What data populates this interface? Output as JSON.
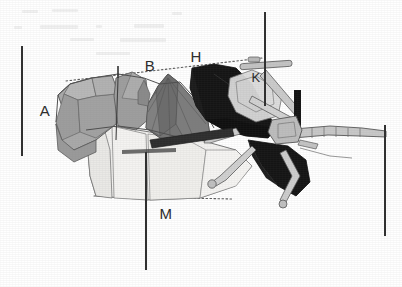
{
  "figure": {
    "background_color": "#ffffff",
    "width": 402,
    "height": 287,
    "palette": {
      "ink": "#2a2a2a",
      "black_fill": "#131313",
      "dark_gray": "#6f6f6f",
      "mid_gray": "#8d8d8d",
      "light_gray": "#a8a8a8",
      "pale_gray": "#c9c9c9",
      "near_white": "#f0f0ef",
      "outline": "#4a4a4a",
      "dotted_guide": "#5a5a5a"
    },
    "labels": [
      {
        "id": "label-a",
        "text": "A",
        "x": 45,
        "y": 116
      },
      {
        "id": "label-i",
        "text": "I",
        "x": 118,
        "y": 73
      },
      {
        "id": "label-b",
        "text": "B",
        "x": 150,
        "y": 71
      },
      {
        "id": "label-h",
        "text": "H",
        "x": 196,
        "y": 62
      },
      {
        "id": "label-k",
        "text": "K",
        "x": 256,
        "y": 82
      },
      {
        "id": "label-m",
        "text": "M",
        "x": 166,
        "y": 219
      }
    ],
    "reference_bars": [
      {
        "id": "scale-bar-left",
        "x1": 22,
        "y1": 46,
        "x2": 22,
        "y2": 156
      },
      {
        "id": "scale-bar-top-right",
        "x1": 265,
        "y1": 12,
        "x2": 265,
        "y2": 106
      },
      {
        "id": "scale-bar-bottom-mid",
        "x1": 146,
        "y1": 152,
        "x2": 146,
        "y2": 270
      },
      {
        "id": "scale-bar-right",
        "x1": 385,
        "y1": 125,
        "x2": 385,
        "y2": 236
      }
    ],
    "guide_lines": [
      {
        "id": "guide-top-dotted",
        "x1": 66,
        "y1": 81,
        "x2": 262,
        "y2": 58
      },
      {
        "id": "guide-bottom-dotted",
        "x1": 94,
        "y1": 196,
        "x2": 232,
        "y2": 199
      }
    ],
    "leader_ticks": [
      {
        "id": "tick-i",
        "x1": 118,
        "y1": 66,
        "x2": 118,
        "y2": 78
      }
    ],
    "regions": [
      {
        "id": "body-left-light",
        "tone": "light_gray"
      },
      {
        "id": "body-dome-dark",
        "tone": "dark_gray"
      },
      {
        "id": "hull-lower-white",
        "tone": "near_white"
      },
      {
        "id": "wing-upper-black",
        "tone": "black_fill"
      },
      {
        "id": "wing-lower-black",
        "tone": "black_fill"
      },
      {
        "id": "strut-assembly",
        "tone": "pale_gray"
      },
      {
        "id": "proboscis-arm",
        "tone": "pale_gray"
      },
      {
        "id": "post-black-bar",
        "tone": "black_fill"
      }
    ]
  }
}
